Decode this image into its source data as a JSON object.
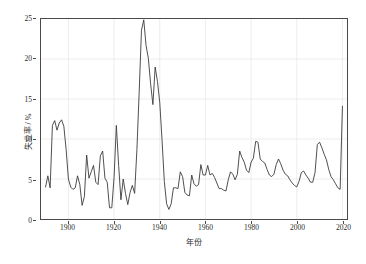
{
  "figure": {
    "width": 366,
    "height": 264,
    "background": "#ffffff"
  },
  "axis_titles": {
    "y": "失业率 / %",
    "x": "年份"
  },
  "style": {
    "line_color": "#3a3a3a",
    "grid_color": "#e8e8e8",
    "spine_color": "#4a4a4a",
    "tick_label_color": "#2b2b2b"
  },
  "chart_data": {
    "type": "line",
    "title": "",
    "xlabel": "年份",
    "ylabel": "失业率 / %",
    "xlim": [
      1888,
      2022
    ],
    "ylim": [
      0,
      25
    ],
    "xticks": [
      1900,
      1920,
      1940,
      1960,
      1980,
      2000,
      2020
    ],
    "yticks": [
      0,
      5,
      10,
      15,
      20,
      25
    ],
    "grid": true,
    "legend": null,
    "series": [
      {
        "name": "失业率",
        "color": "#3a3a3a",
        "x": [
          1890,
          1891,
          1892,
          1893,
          1894,
          1895,
          1896,
          1897,
          1898,
          1899,
          1900,
          1901,
          1902,
          1903,
          1904,
          1905,
          1906,
          1907,
          1908,
          1909,
          1910,
          1911,
          1912,
          1913,
          1914,
          1915,
          1916,
          1917,
          1918,
          1919,
          1920,
          1921,
          1922,
          1923,
          1924,
          1925,
          1926,
          1927,
          1928,
          1929,
          1930,
          1931,
          1932,
          1933,
          1934,
          1935,
          1936,
          1937,
          1938,
          1939,
          1940,
          1941,
          1942,
          1943,
          1944,
          1945,
          1946,
          1947,
          1948,
          1949,
          1950,
          1951,
          1952,
          1953,
          1954,
          1955,
          1956,
          1957,
          1958,
          1959,
          1960,
          1961,
          1962,
          1963,
          1964,
          1965,
          1966,
          1967,
          1968,
          1969,
          1970,
          1971,
          1972,
          1973,
          1974,
          1975,
          1976,
          1977,
          1978,
          1979,
          1980,
          1981,
          1982,
          1983,
          1984,
          1985,
          1986,
          1987,
          1988,
          1989,
          1990,
          1991,
          1992,
          1993,
          1994,
          1995,
          1996,
          1997,
          1998,
          1999,
          2000,
          2001,
          2002,
          2003,
          2004,
          2005,
          2006,
          2007,
          2008,
          2009,
          2010,
          2011,
          2012,
          2013,
          2014,
          2015,
          2016,
          2017,
          2018,
          2019,
          2020
        ],
        "values": [
          4.0,
          5.4,
          3.9,
          11.7,
          12.3,
          11.1,
          12.0,
          12.4,
          11.6,
          8.7,
          5.0,
          4.0,
          3.7,
          3.9,
          5.4,
          4.3,
          1.7,
          2.8,
          8.0,
          5.1,
          5.9,
          6.7,
          4.6,
          4.3,
          7.9,
          8.5,
          5.1,
          4.6,
          1.4,
          1.4,
          5.2,
          11.7,
          6.7,
          2.4,
          5.0,
          3.2,
          1.8,
          3.3,
          4.2,
          3.2,
          8.7,
          15.9,
          23.6,
          24.9,
          21.7,
          20.1,
          16.9,
          14.3,
          19.0,
          17.2,
          14.6,
          9.9,
          4.7,
          1.9,
          1.2,
          1.9,
          3.9,
          3.9,
          3.8,
          5.9,
          5.3,
          3.3,
          3.0,
          2.9,
          5.5,
          4.4,
          4.1,
          4.3,
          6.8,
          5.5,
          5.5,
          6.7,
          5.5,
          5.7,
          5.2,
          4.5,
          3.8,
          3.8,
          3.6,
          3.5,
          4.9,
          5.9,
          5.6,
          4.9,
          5.6,
          8.5,
          7.7,
          7.1,
          6.1,
          5.8,
          7.1,
          7.6,
          9.7,
          9.6,
          7.5,
          7.2,
          7.0,
          6.2,
          5.5,
          5.3,
          5.6,
          6.8,
          7.5,
          6.9,
          6.1,
          5.6,
          5.4,
          4.9,
          4.5,
          4.2,
          4.0,
          4.7,
          5.8,
          6.0,
          5.5,
          5.1,
          4.6,
          4.6,
          5.8,
          9.3,
          9.6,
          8.9,
          8.1,
          7.4,
          6.2,
          5.3,
          4.9,
          4.4,
          3.9,
          3.7,
          14.1
        ]
      }
    ]
  }
}
